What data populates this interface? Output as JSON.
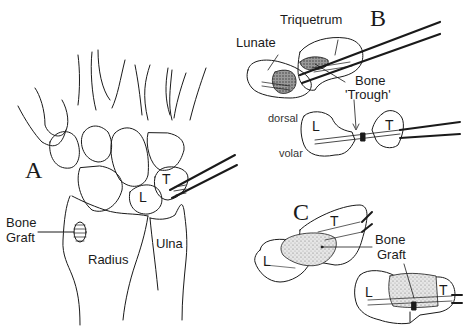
{
  "figure": {
    "panels": {
      "a": "A",
      "b": "B",
      "c": "C"
    },
    "panel_a": {
      "bone_graft_line1": "Bone",
      "bone_graft_line2": "Graft",
      "radius": "Radius",
      "ulna": "Ulna",
      "lunate_abbr": "L",
      "triquetrum_abbr": "T"
    },
    "panel_b": {
      "triquetrum": "Triquetrum",
      "lunate": "Lunate",
      "bone_trough_line1": "Bone",
      "bone_trough_line2": "'Trough'",
      "dorsal": "dorsal",
      "volar": "volar",
      "lunate_abbr": "L",
      "triquetrum_abbr": "T"
    },
    "panel_c": {
      "lunate_abbr_top": "L",
      "triquetrum_abbr_top": "T",
      "bone_graft_line1": "Bone",
      "bone_graft_line2": "Graft",
      "lunate_abbr_bottom": "L",
      "triquetrum_abbr_bottom": "T"
    }
  },
  "colors": {
    "ink": "#1a1a1a",
    "graft_fill": "#d4d4d4",
    "background": "#ffffff"
  }
}
